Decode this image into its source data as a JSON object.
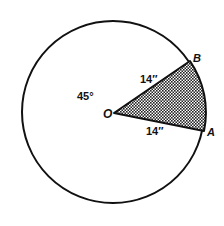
{
  "diagram": {
    "circle": {
      "cx": 113,
      "cy": 112,
      "r": 91,
      "stroke": "#111111"
    },
    "center_label": "O",
    "point_a_label": "A",
    "point_b_label": "B",
    "radius_ob_label": "14″",
    "radius_oa_label": "14″",
    "angle_label": "45°",
    "sector_fill": "dotted-pattern",
    "sector_angle_deg": 45,
    "radius_inches": 14
  }
}
